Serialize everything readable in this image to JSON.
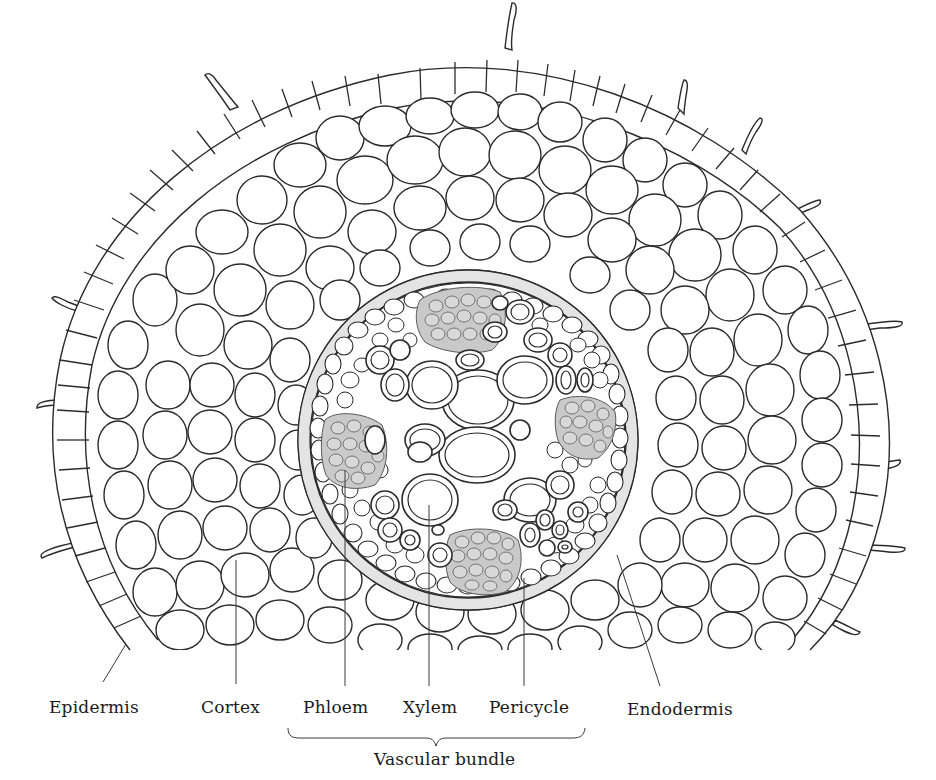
{
  "figure": {
    "labels": {
      "epidermis": "Epidermis",
      "cortex": "Cortex",
      "phloem": "Phloem",
      "xylem": "Xylem",
      "pericycle": "Pericycle",
      "endodermis": "Endodermis",
      "vascular_bundle": "Vascular bundle"
    },
    "colors": {
      "line": "#2b2b2b",
      "phloem_fill": "#c9c9c9",
      "endodermis_fill": "#e4e4e4",
      "background": "#ffffff"
    }
  }
}
